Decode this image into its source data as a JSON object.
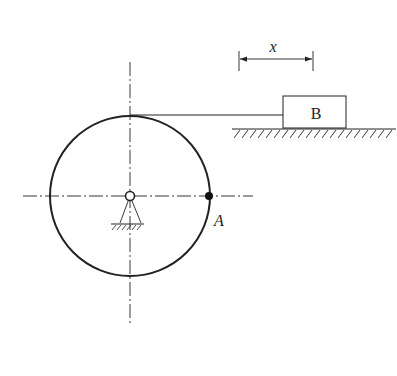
{
  "diagram": {
    "labels": {
      "block": "B",
      "point": "A",
      "displacement": "x"
    },
    "colors": {
      "stroke": "#222222",
      "background": "#ffffff"
    },
    "disk": {
      "cx": 130,
      "cy": 196,
      "r": 80
    },
    "block": {
      "x": 283,
      "y": 96,
      "width": 63,
      "height": 32
    },
    "ground_line": {
      "x1": 232,
      "x2": 396,
      "y": 129
    }
  }
}
